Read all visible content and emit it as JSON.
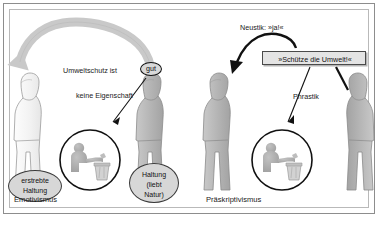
{
  "diagram": {
    "left_panel": {
      "caption": "Emotivismus",
      "arrow_label_prefix": "Umweltschutz ist",
      "evaluation_token": "gut",
      "property_label": "keine Eigenschaft",
      "speaker_ellipse": "erstrebte\nHaltung",
      "speaker_ellipse_lines": [
        "erstrebte",
        "Haltung"
      ],
      "listener_ellipse_lines": [
        "Haltung",
        "(liebt",
        "Natur)"
      ],
      "icon": "person-recycling-icon"
    },
    "right_panel": {
      "caption": "Präskriptivismus",
      "neustic_label": "Neustik: »ja!«",
      "utterance": "»Schütze die Umwelt!«",
      "phrastic_label": "Phrastik",
      "icon": "person-recycling-icon"
    },
    "colors": {
      "frame_outer": "#8d8d8d",
      "frame_inner": "#b9b9b9",
      "figure_fill": "#b6b6b6",
      "figure_outline": "#8a8a8a",
      "big_arrow": "#c9c9c9",
      "thin_arrow": "#111111",
      "callout_fill": "#d7d7d7",
      "box_fill": "#e4e4e4",
      "text": "#1a1a1a"
    }
  }
}
